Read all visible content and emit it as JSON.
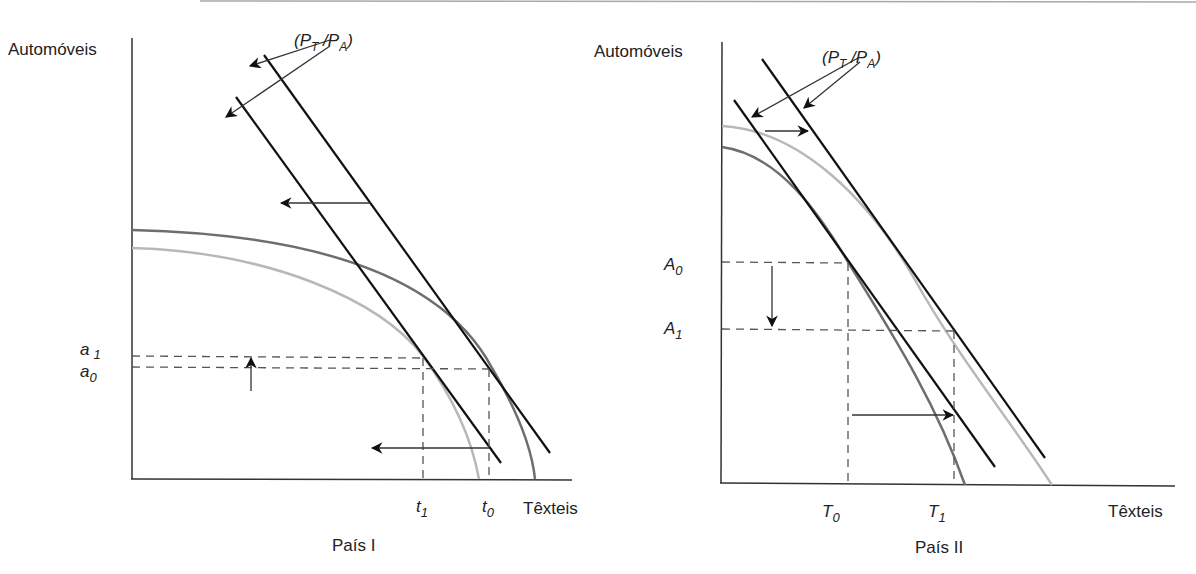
{
  "figure": {
    "top_rule_color": "#9a9a9a",
    "colors": {
      "axis": "#333333",
      "price_line": "#111111",
      "ppf_dark": "#6e6e6e",
      "ppf_light": "#b8b8b8",
      "dashed": "#555555",
      "arrow": "#111111"
    }
  },
  "panels": [
    {
      "id": "pais-1",
      "title": "País I",
      "y_axis_label": "Automóveis",
      "x_axis_label": "Têxteis",
      "price_label": {
        "open": "(",
        "p1": "P",
        "s1": "T",
        "slash": " /",
        "p2": "P",
        "s2": "A",
        "close": ")"
      },
      "y_ticks": [
        {
          "name": "a1",
          "base": "a",
          "sub": "1"
        },
        {
          "name": "a0",
          "base": "a",
          "sub": "0"
        }
      ],
      "x_ticks": [
        {
          "name": "t1",
          "base": "t",
          "sub": "1"
        },
        {
          "name": "t0",
          "base": "t",
          "sub": "0"
        }
      ],
      "curves": [
        "production-frontier-before (dark)",
        "production-frontier-after (light)"
      ],
      "shifts": [
        "price line shifts left",
        "automobile production rises a0→a1",
        "textile production falls t0→t1"
      ]
    },
    {
      "id": "pais-2",
      "title": "País II",
      "y_axis_label": "Automóveis",
      "x_axis_label": "Têxteis",
      "price_label": {
        "open": "(",
        "p1": "P",
        "s1": "T",
        "slash": " /",
        "p2": "P",
        "s2": "A",
        "close": ")"
      },
      "y_ticks": [
        {
          "name": "A0",
          "base": "A",
          "sub": "0"
        },
        {
          "name": "A1",
          "base": "A",
          "sub": "1"
        }
      ],
      "x_ticks": [
        {
          "name": "T0",
          "base": "T",
          "sub": "0"
        },
        {
          "name": "T1",
          "base": "T",
          "sub": "1"
        }
      ],
      "curves": [
        "production-frontier-before (dark)",
        "production-frontier-after (light)"
      ],
      "shifts": [
        "price line shifts right",
        "automobile production falls A0→A1",
        "textile production rises T0→T1"
      ]
    }
  ]
}
